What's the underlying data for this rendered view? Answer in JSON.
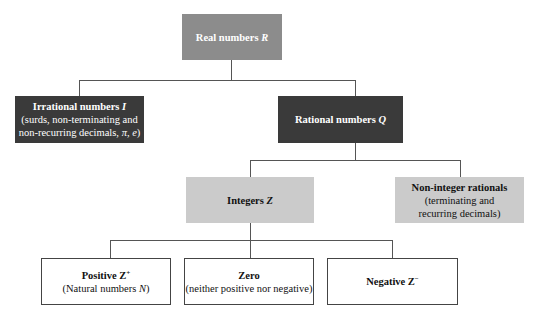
{
  "diagram": {
    "root": {
      "title": "Real numbers",
      "symbol": "R",
      "color": "#8c8c8c"
    },
    "irrational": {
      "title": "Irrational numbers",
      "symbol": "I",
      "line1": "(surds, non-terminating and",
      "line2": "non-recurring decimals, ",
      "line2_symbols": "π, e",
      "line2_end": ")",
      "color": "#3a3a3a"
    },
    "rational": {
      "title": "Rational numbers",
      "symbol": "Q",
      "color": "#3a3a3a"
    },
    "integers": {
      "title": "Integers",
      "symbol": "Z",
      "color": "#cbcbcb"
    },
    "non_integer": {
      "title": "Non-integer rationals",
      "line1": "(terminating and",
      "line2": "recurring decimals)",
      "color": "#cbcbcb"
    },
    "positive": {
      "title": "Positive Z",
      "sup": "+",
      "subtitle_pre": "(Natural numbers ",
      "subtitle_symbol": "N",
      "subtitle_end": ")"
    },
    "zero": {
      "title": "Zero",
      "subtitle": "(neither positive nor negative)"
    },
    "negative": {
      "title": "Negative Z",
      "sup": "−"
    }
  }
}
